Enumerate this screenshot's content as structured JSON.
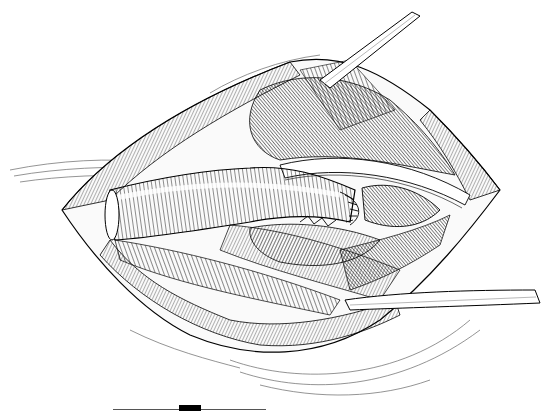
{
  "figure": {
    "type": "surgical-illustration",
    "style": "pen-and-ink line drawing",
    "colors": {
      "ink": "#000000",
      "background": "#ffffff",
      "scale_line": "#555555"
    },
    "elements": [
      "wound-opening",
      "vascular-graft",
      "upper-retractor",
      "lower-retractor",
      "muscle-fibers",
      "sutured-anastomosis",
      "skin-folds"
    ]
  },
  "scale_bar": {
    "visible": true,
    "segments": 1
  }
}
